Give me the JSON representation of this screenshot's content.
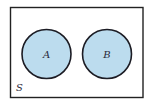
{
  "diagram": {
    "type": "venn",
    "universe": {
      "label": "S",
      "x": 10.5,
      "y": 7.5,
      "width": 132.5,
      "height": 90,
      "stroke": "#222222",
      "fill": "#ffffff"
    },
    "sets": [
      {
        "label": "A",
        "cx": 46.5,
        "cy": 54,
        "r": 24.5,
        "fill": "#bcdcee",
        "stroke": "#1c1c24"
      },
      {
        "label": "B",
        "cx": 107,
        "cy": 54,
        "r": 24.5,
        "fill": "#bcdcee",
        "stroke": "#1c1c24"
      }
    ],
    "overlap": false
  }
}
